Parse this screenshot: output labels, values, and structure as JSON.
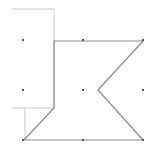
{
  "diagram": {
    "type": "polygon-on-grid",
    "background": "#ffffff",
    "grid_dots": {
      "color": "#555555",
      "xs": [
        23,
        83,
        143
      ],
      "ys": [
        40,
        90,
        140
      ]
    },
    "light_outline": {
      "color": "#c8c8c8",
      "points": [
        [
          12,
          9
        ],
        [
          54,
          9
        ],
        [
          54,
          108
        ],
        [
          12,
          108
        ]
      ],
      "connector": [
        [
          25,
          108
        ],
        [
          25,
          140
        ]
      ]
    },
    "main_polygon": {
      "color": "#8a8a8a",
      "points": [
        [
          54,
          41
        ],
        [
          143,
          41
        ],
        [
          98,
          90
        ],
        [
          143,
          140
        ],
        [
          24,
          140
        ],
        [
          54,
          108
        ]
      ]
    }
  }
}
